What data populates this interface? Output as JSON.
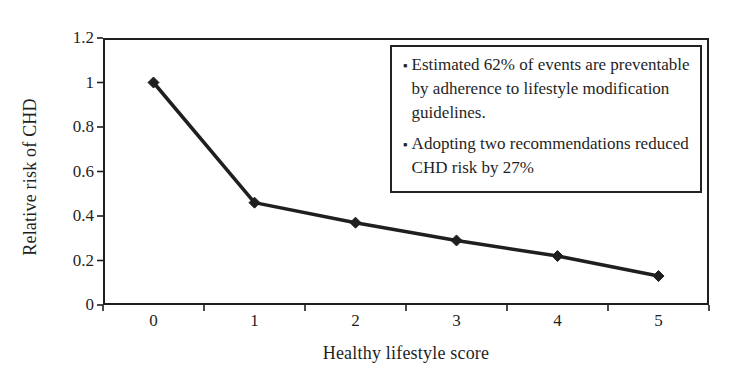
{
  "page": {
    "background": "#ffffff",
    "ink": "#1f1f1f"
  },
  "chart_data": {
    "type": "line",
    "title": "",
    "xlabel": "Healthy lifestyle score",
    "ylabel": "Relative risk of CHD",
    "categories": [
      "0",
      "1",
      "2",
      "3",
      "4",
      "5"
    ],
    "series": [
      {
        "name": "Relative risk of CHD",
        "values": [
          1.0,
          0.46,
          0.37,
          0.29,
          0.22,
          0.13
        ]
      }
    ],
    "xlim_categories": 6,
    "ylim": [
      0,
      1.2
    ],
    "yticks": [
      0,
      0.2,
      0.4,
      0.6,
      0.8,
      1,
      1.2
    ],
    "ytick_labels": [
      "0",
      "0.2",
      "0.4",
      "0.6",
      "0.8",
      "1",
      "1.2"
    ],
    "grid": false,
    "legend_position": "none",
    "marker": "diamond",
    "line_color": "#1f1f1f",
    "marker_color": "#1f1f1f",
    "axis_tick_style": "category-boundary-ticks"
  },
  "annotation_box": {
    "bullet_icon": "square-bullet",
    "items": [
      {
        "text": "Estimated 62% of events are preventable by adherence to lifestyle modification guidelines."
      },
      {
        "text": "Adopting two recommendations reduced CHD risk by 27%"
      }
    ]
  }
}
